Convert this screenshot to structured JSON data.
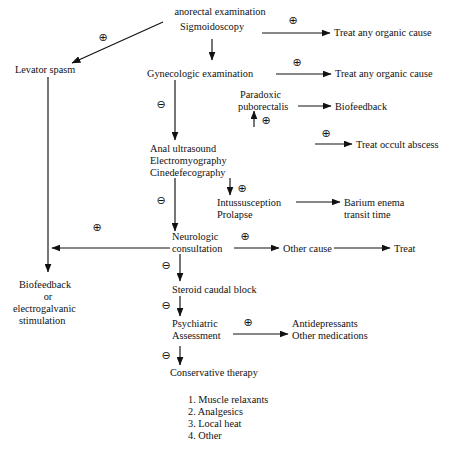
{
  "diagram": {
    "symbols": {
      "positive": "⊕",
      "negative": "⊖"
    },
    "nodes": {
      "anorectal_exam": {
        "line1": "anorectal examination",
        "line2": "Sigmoidoscopy"
      },
      "levator_spasm": {
        "line1": "Levator spasm"
      },
      "treat_organic_1": {
        "line1": "Treat any organic cause"
      },
      "gynecologic_exam": {
        "line1": "Gynecologic examination"
      },
      "treat_organic_2": {
        "line1": "Treat any organic cause"
      },
      "paradoxic_puborectalis": {
        "line1": "Paradoxic",
        "line2": "puborectalis"
      },
      "biofeedback_1": {
        "line1": "Biofeedback"
      },
      "treat_occult_abscess": {
        "line1": "Treat occult abscess"
      },
      "anal_studies": {
        "line1": "Anal ultrasound",
        "line2": "Electromyography",
        "line3": "Cinedefecography"
      },
      "intussusception": {
        "line1": "Intussusception",
        "line2": "Prolapse"
      },
      "barium_enema": {
        "line1": "Barium enema",
        "line2": "transit time"
      },
      "neurologic": {
        "line1": "Neurologic",
        "line2": "consultation"
      },
      "other_cause": {
        "line1": "Other cause"
      },
      "treat": {
        "line1": "Treat"
      },
      "biofeedback_egs": {
        "line1": "Biofeedback",
        "line2": "or",
        "line3": "electrogalvanic",
        "line4": "stimulation"
      },
      "steroid_block": {
        "line1": "Steroid caudal block"
      },
      "psychiatric": {
        "line1": "Psychiatric",
        "line2": "Assessment"
      },
      "antidepressants": {
        "line1": "Antidepressants",
        "line2": "Other medications"
      },
      "conservative_therapy": {
        "line1": "Conservative therapy"
      }
    },
    "therapy_list": [
      "1. Muscle relaxants",
      "2. Analgesics",
      "3. Local heat",
      "4. Other"
    ],
    "edge_signs": {
      "to_levator": "⊕",
      "sigmoid_to_treat": "⊕",
      "gyn_negative": "⊖",
      "gyn_to_treat": "⊕",
      "to_puborectalis": "⊕",
      "to_occult_abscess": "⊕",
      "anal_negative": "⊖",
      "to_intussusception": "⊕",
      "to_biofeedback_egs": "⊕",
      "neuro_to_other": "⊕",
      "neuro_negative": "⊖",
      "steroid_negative": "⊖",
      "psych_positive": "⊕",
      "psych_negative": "⊖"
    },
    "caption": "",
    "colors": {
      "ink": "#111111",
      "background": "#ffffff"
    }
  }
}
